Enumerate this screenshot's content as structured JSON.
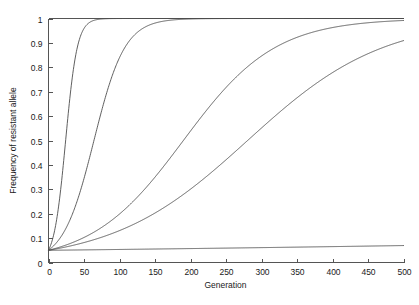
{
  "chart_data": {
    "type": "line",
    "title": "",
    "subtitle": "",
    "xlabel": "Generation",
    "ylabel": "Frequency of resistant allele",
    "xlim": [
      0,
      500
    ],
    "ylim": [
      0,
      1
    ],
    "grid": false,
    "legend": "none",
    "background": "#ffffff",
    "line_color": "#4d4d4d",
    "axis_color": "#555555",
    "text_color": "#1a1a1a",
    "x_ticks": [
      0,
      50,
      100,
      150,
      200,
      250,
      300,
      350,
      400,
      450,
      500
    ],
    "x_tick_labels": [
      "0",
      "50",
      "100",
      "150",
      "200",
      "250",
      "300",
      "350",
      "400",
      "450",
      "500"
    ],
    "y_ticks": [
      0,
      0.1,
      0.2,
      0.3,
      0.4,
      0.5,
      0.6,
      0.7,
      0.8,
      0.9,
      1
    ],
    "y_tick_labels": [
      "0",
      "0.1",
      "0.2",
      "0.3",
      "0.4",
      "0.5",
      "0.6",
      "0.7",
      "0.8",
      "0.9",
      "1"
    ],
    "initial_frequency": 0.05,
    "model": "logistic",
    "series": [
      {
        "name": "curve-1",
        "midpoint_generation": 27,
        "x": [
          0,
          5,
          10,
          15,
          20,
          25,
          30,
          35,
          40,
          45,
          50,
          60,
          70,
          80,
          100,
          150,
          200,
          250,
          300,
          350,
          400,
          450,
          500
        ],
        "values": [
          0.05,
          0.087,
          0.147,
          0.236,
          0.355,
          0.49,
          0.624,
          0.739,
          0.828,
          0.89,
          0.931,
          0.973,
          0.99,
          0.996,
          0.999,
          1.0,
          1.0,
          1.0,
          1.0,
          1.0,
          1.0,
          1.0,
          1.0
        ]
      },
      {
        "name": "curve-2",
        "midpoint_generation": 63,
        "x": [
          0,
          10,
          20,
          30,
          40,
          50,
          60,
          70,
          80,
          90,
          100,
          120,
          150,
          200,
          250,
          300,
          350,
          400,
          450,
          500
        ],
        "values": [
          0.05,
          0.075,
          0.111,
          0.161,
          0.228,
          0.312,
          0.409,
          0.513,
          0.615,
          0.706,
          0.781,
          0.885,
          0.958,
          0.993,
          0.999,
          1.0,
          1.0,
          1.0,
          1.0,
          1.0
        ]
      },
      {
        "name": "curve-3",
        "midpoint_generation": 183,
        "x": [
          0,
          20,
          40,
          60,
          80,
          100,
          120,
          140,
          160,
          180,
          200,
          220,
          240,
          260,
          280,
          300,
          350,
          400,
          450,
          500
        ],
        "values": [
          0.05,
          0.06,
          0.072,
          0.087,
          0.104,
          0.124,
          0.148,
          0.176,
          0.207,
          0.243,
          0.282,
          0.325,
          0.371,
          0.419,
          0.468,
          0.518,
          0.641,
          0.747,
          0.829,
          0.888
        ]
      },
      {
        "name": "curve-4",
        "midpoint_generation": 385,
        "x": [
          0,
          25,
          50,
          75,
          100,
          150,
          200,
          250,
          300,
          350,
          375,
          400,
          425,
          450,
          475,
          500
        ],
        "values": [
          0.05,
          0.053,
          0.056,
          0.059,
          0.063,
          0.07,
          0.078,
          0.087,
          0.097,
          0.108,
          0.114,
          0.12,
          0.127,
          0.134,
          0.141,
          0.148
        ]
      },
      {
        "name": "curve-5",
        "midpoint_generation": 999,
        "x": [
          0,
          50,
          100,
          150,
          200,
          250,
          300,
          350,
          400,
          450,
          500
        ],
        "values": [
          0.05,
          0.052,
          0.054,
          0.056,
          0.058,
          0.06,
          0.062,
          0.064,
          0.066,
          0.069,
          0.071
        ]
      }
    ],
    "curve_params": [
      {
        "name": "curve-1",
        "k": 0.122,
        "x0": 27
      },
      {
        "name": "curve-2",
        "k": 0.046,
        "x0": 63
      },
      {
        "name": "curve-3",
        "k": 0.0155,
        "x0": 183
      },
      {
        "name": "curve-4",
        "k": 0.0105,
        "x0": 385
      },
      {
        "name": "curve-5",
        "k": 0.0007,
        "x0": 999
      }
    ]
  }
}
